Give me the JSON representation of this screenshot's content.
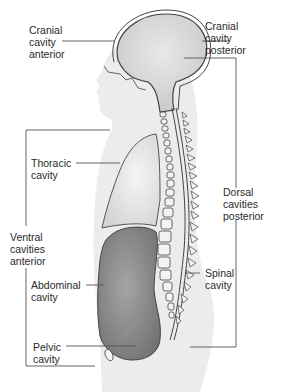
{
  "labels": {
    "cranial_anterior": "Cranial\ncavity\nanterior",
    "cranial_posterior": "Cranial\ncavity\nposterior",
    "thoracic": "Thoracic\ncavity",
    "dorsal": "Dorsal\ncavities\nposterior",
    "ventral": "Ventral\ncavities\nanterior",
    "abdominal": "Abdominal\ncavity",
    "spinal": "Spinal\ncavity",
    "pelvic": "Pelvic\ncavity"
  },
  "colors": {
    "body_silhouette": "#ececec",
    "cranial_fill": "#d9d9d9",
    "thoracic_fill": "#e4e4e4",
    "abdominal_fill": "#8f8f8f",
    "outline": "#444444",
    "leader_line": "#555555"
  }
}
